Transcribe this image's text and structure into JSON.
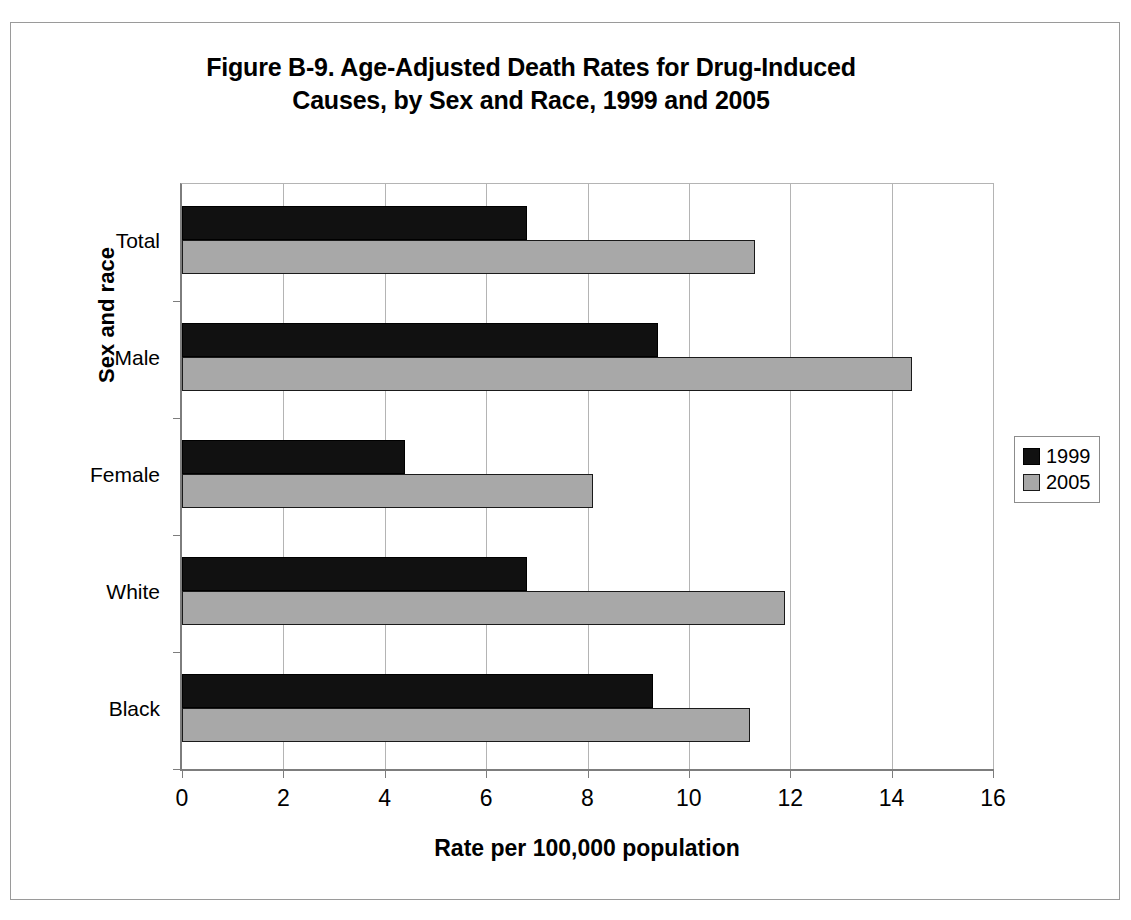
{
  "figure": {
    "title_line1": "Figure B-9. Age-Adjusted Death Rates for Drug-Induced",
    "title_line2": "Causes, by Sex and Race, 1999 and 2005"
  },
  "colors": {
    "series_1999": "#111111",
    "series_2005": "#a8a8a8",
    "gridline": "#b4b4b4",
    "axis": "#7d7d7d",
    "frame": "#9a9a9a"
  },
  "legend": {
    "position": "right",
    "entries": [
      {
        "label": "1999",
        "color": "#111111"
      },
      {
        "label": "2005",
        "color": "#a8a8a8"
      }
    ]
  },
  "chart_data": {
    "type": "bar",
    "orientation": "horizontal",
    "title": "Figure B-9. Age-Adjusted Death Rates for Drug-Induced Causes, by Sex and Race, 1999 and 2005",
    "xlabel": "Rate per 100,000 population",
    "ylabel": "Sex and race",
    "categories": [
      "Total",
      "Male",
      "Female",
      "White",
      "Black"
    ],
    "series": [
      {
        "name": "1999",
        "values": [
          6.8,
          9.4,
          4.4,
          6.8,
          9.3
        ]
      },
      {
        "name": "2005",
        "values": [
          11.3,
          14.4,
          8.1,
          11.9,
          11.2
        ]
      }
    ],
    "xlim": [
      0,
      16
    ],
    "xticks": [
      0,
      2,
      4,
      6,
      8,
      10,
      12,
      14,
      16
    ],
    "xtick_labels": [
      "0",
      "2",
      "4",
      "6",
      "8",
      "10",
      "12",
      "14",
      "16"
    ],
    "grid": "vertical",
    "legend_entries": [
      "1999",
      "2005"
    ]
  }
}
